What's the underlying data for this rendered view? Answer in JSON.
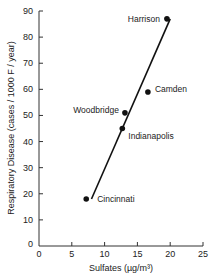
{
  "chart_data": {
    "type": "scatter",
    "title": "",
    "xlabel": "Sulfates (µg/m³)",
    "ylabel": "Respiratory Disease (cases / 1000 F / year)",
    "xlim": [
      0,
      25
    ],
    "ylim": [
      0,
      90
    ],
    "xticks": [
      0,
      5,
      10,
      15,
      20,
      25
    ],
    "yticks": [
      0,
      10,
      20,
      30,
      40,
      50,
      60,
      70,
      80,
      90
    ],
    "grid": false,
    "legend": null,
    "points": [
      {
        "label": "Harrison",
        "x": 19.5,
        "y": 87
      },
      {
        "label": "Camden",
        "x": 16.6,
        "y": 59
      },
      {
        "label": "Woodbridge",
        "x": 13.1,
        "y": 51
      },
      {
        "label": "Indianapolis",
        "x": 12.7,
        "y": 45
      },
      {
        "label": "Cincinnati",
        "x": 7.2,
        "y": 18
      }
    ],
    "trend_line": {
      "x": [
        8.0,
        20.0
      ],
      "y": [
        18,
        87
      ]
    }
  }
}
